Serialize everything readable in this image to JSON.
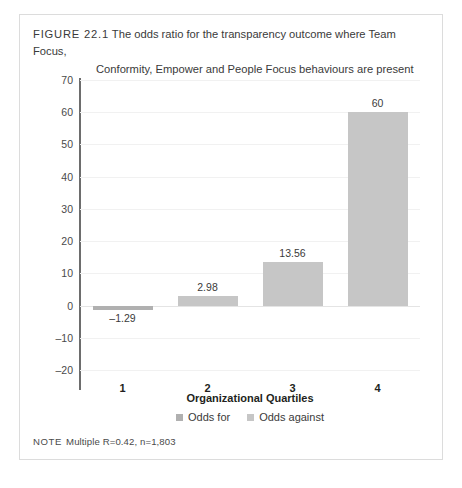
{
  "figure": {
    "label": "FIGURE 22.1",
    "caption_line1": "The odds ratio for the transparency outcome where Team Focus,",
    "caption_line2": "Conformity, Empower and People Focus behaviours are present",
    "note_label": "NOTE",
    "note_text": "Multiple R=0.42, n=1,803"
  },
  "chart_data": {
    "type": "bar",
    "title": "The odds ratio for the transparency outcome where Team Focus, Conformity, Empower and People Focus behaviours are present",
    "categories": [
      "1",
      "2",
      "3",
      "4"
    ],
    "values": [
      -1.29,
      2.98,
      13.56,
      60
    ],
    "data_labels": [
      "–1.29",
      "2.98",
      "13.56",
      "60"
    ],
    "point_series": [
      "Odds for",
      "Odds against",
      "Odds against",
      "Odds against"
    ],
    "xlabel": "Organizational Quartiles",
    "ylabel": "",
    "ylim": [
      -20,
      70
    ],
    "ytick_values": [
      70,
      60,
      50,
      40,
      30,
      20,
      10,
      0,
      -10,
      -20
    ],
    "ytick_labels": [
      "70",
      "60",
      "50",
      "40",
      "30",
      "20",
      "10",
      "0",
      "–10",
      "–20"
    ],
    "grid": true,
    "legend_position": "bottom",
    "legend": [
      {
        "label": "Odds for",
        "color": "#b0b0b0"
      },
      {
        "label": "Odds against",
        "color": "#c6c6c6"
      }
    ]
  },
  "colors": {
    "odds_for": "#b0b0b0",
    "odds_against": "#c6c6c6",
    "axis": "#6d6d6d",
    "grid": "#f1f1f1",
    "frame": "#dcdcdc"
  }
}
